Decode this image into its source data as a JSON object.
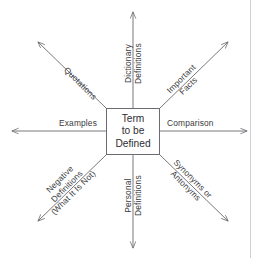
{
  "diagram": {
    "type": "concept-definition-web",
    "center": {
      "lines": [
        "Term",
        "to be",
        "Defined"
      ],
      "full_text": "Term to be Defined"
    },
    "colors": {
      "line": "#6a6a70",
      "text": "#3b3b40",
      "center_text": "#2e2e33",
      "background": "#ffffff",
      "edge_rule": "#cfcfd4"
    },
    "spokes": [
      {
        "id": "north",
        "direction": "up",
        "label_lines": [
          "Dictionary",
          "Definitions"
        ],
        "full_text": "Dictionary Definitions",
        "rotation_deg": -90
      },
      {
        "id": "northeast",
        "direction": "up-right",
        "label_lines": [
          "Important",
          "Facts"
        ],
        "full_text": "Important Facts",
        "rotation_deg": -45
      },
      {
        "id": "east",
        "direction": "right",
        "label_lines": [
          "Comparison"
        ],
        "full_text": "Comparison",
        "rotation_deg": 0
      },
      {
        "id": "southeast",
        "direction": "down-right",
        "label_lines": [
          "Synonyms or",
          "Antonyms"
        ],
        "full_text": "Synonyms or Antonyms",
        "rotation_deg": 45
      },
      {
        "id": "south",
        "direction": "down",
        "label_lines": [
          "Personal",
          "Definitions"
        ],
        "full_text": "Personal Definitions",
        "rotation_deg": -90
      },
      {
        "id": "southwest",
        "direction": "down-left",
        "label_lines": [
          "Negative",
          "Definitions",
          "(What It Is Not)"
        ],
        "full_text": "Negative Definitions (What It Is Not)",
        "rotation_deg": -45
      },
      {
        "id": "west",
        "direction": "left",
        "label_lines": [
          "Examples"
        ],
        "full_text": "Examples",
        "rotation_deg": 0
      },
      {
        "id": "northwest",
        "direction": "up-left",
        "label_lines": [
          "Quotations"
        ],
        "full_text": "Quotations",
        "rotation_deg": 45
      }
    ]
  }
}
